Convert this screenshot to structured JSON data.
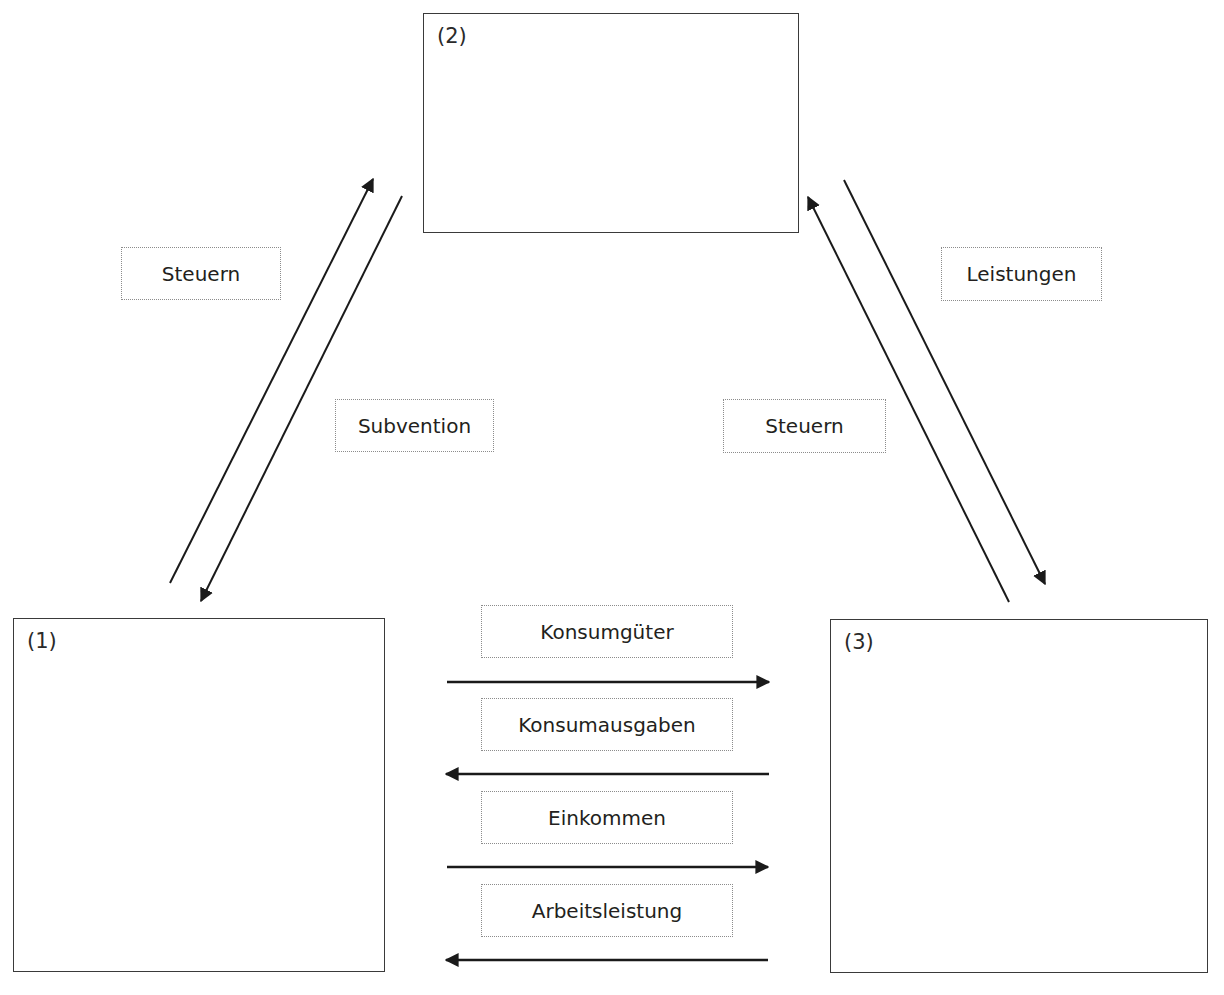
{
  "diagram": {
    "type": "economic-circular-flow",
    "sectors": [
      {
        "id": "1",
        "label": "(1)"
      },
      {
        "id": "2",
        "label": "(2)"
      },
      {
        "id": "3",
        "label": "(3)"
      }
    ],
    "flows": {
      "sector1_to_2": {
        "label": "Steuern",
        "from": "1",
        "to": "2"
      },
      "sector2_to_1": {
        "label": "Subvention",
        "from": "2",
        "to": "1"
      },
      "sector3_to_2": {
        "label": "Steuern",
        "from": "3",
        "to": "2"
      },
      "sector2_to_3": {
        "label": "Leistungen",
        "from": "2",
        "to": "3"
      },
      "consumer_goods": {
        "label": "Konsumgüter",
        "from": "1",
        "to": "3",
        "direction": "right"
      },
      "consumer_spending": {
        "label": "Konsumausgaben",
        "from": "3",
        "to": "1",
        "direction": "left"
      },
      "income": {
        "label": "Einkommen",
        "from": "1",
        "to": "3",
        "direction": "right"
      },
      "labor": {
        "label": "Arbeitsleistung",
        "from": "3",
        "to": "1",
        "direction": "left"
      }
    },
    "colors": {
      "line": "#1a1a1a",
      "box_border": "#3a3a3a",
      "label_border": "#8c8c8c",
      "background": "#ffffff"
    }
  }
}
